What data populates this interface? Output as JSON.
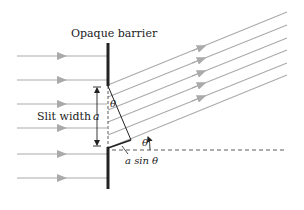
{
  "diagram": {
    "title_label": "Opaque barrier",
    "slit_label": "Slit width",
    "width_symbol": "a",
    "angle_symbol": "θ",
    "path_difference_label": "a sin θ",
    "colors": {
      "ray": "#aaaaaa",
      "barrier": "#222222",
      "construction": "#333333"
    },
    "incoming_ray_count": 6,
    "diffracted_ray_count": 6
  }
}
